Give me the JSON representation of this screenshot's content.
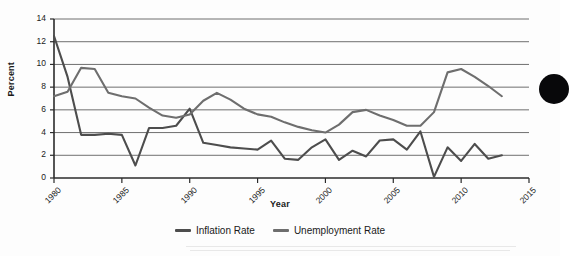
{
  "chart_data": {
    "type": "line",
    "title": "",
    "xlabel": "Year",
    "ylabel": "Percent",
    "xlim": [
      1980,
      2015
    ],
    "ylim": [
      0,
      14
    ],
    "ytick_step": 2,
    "xtick_step": 5,
    "grid": "horizontal",
    "legend_position": "bottom-center",
    "x": [
      1980,
      1981,
      1982,
      1983,
      1984,
      1985,
      1986,
      1987,
      1988,
      1989,
      1990,
      1991,
      1992,
      1993,
      1994,
      1995,
      1996,
      1997,
      1998,
      1999,
      2000,
      2001,
      2002,
      2003,
      2004,
      2005,
      2006,
      2007,
      2008,
      2009,
      2010,
      2011,
      2012,
      2013
    ],
    "ytick_labels": [
      "0",
      "2",
      "4",
      "6",
      "8",
      "10",
      "12",
      "14"
    ],
    "xtick_labels": [
      "1980",
      "1985",
      "1990",
      "1995",
      "2000",
      "2005",
      "2010",
      "2015"
    ],
    "series": [
      {
        "name": "Inflation Rate",
        "color": "#4d4d4d",
        "values": [
          12.5,
          8.9,
          3.8,
          3.8,
          3.9,
          3.8,
          1.1,
          4.4,
          4.4,
          4.6,
          6.1,
          3.1,
          2.9,
          2.7,
          2.6,
          2.5,
          3.3,
          1.7,
          1.6,
          2.7,
          3.4,
          1.6,
          2.4,
          1.9,
          3.3,
          3.4,
          2.5,
          4.1,
          0.1,
          2.7,
          1.5,
          3.0,
          1.7,
          2.0
        ]
      },
      {
        "name": "Unemployment Rate",
        "color": "#6e6e6e",
        "values": [
          7.2,
          7.6,
          9.7,
          9.6,
          7.5,
          7.2,
          7.0,
          6.2,
          5.5,
          5.3,
          5.6,
          6.8,
          7.5,
          6.9,
          6.1,
          5.6,
          5.4,
          4.9,
          4.5,
          4.2,
          4.0,
          4.7,
          5.8,
          6.0,
          5.5,
          5.1,
          4.6,
          4.6,
          5.8,
          9.3,
          9.6,
          8.9,
          8.1,
          7.2
        ]
      }
    ]
  },
  "legend": {
    "items": [
      {
        "label": "Inflation Rate",
        "color": "#4d4d4d"
      },
      {
        "label": "Unemployment Rate",
        "color": "#6e6e6e"
      }
    ]
  },
  "axes": {
    "x_title": "Year",
    "y_title": "Percent"
  },
  "decoration": {
    "edge_blob_name": "page-edge-dot"
  }
}
